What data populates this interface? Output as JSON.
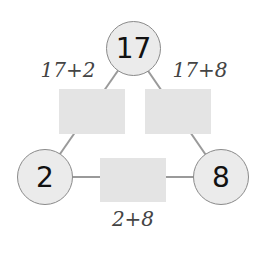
{
  "nodes": {
    "top": "17",
    "left": "2",
    "right": "8"
  },
  "edge_labels": {
    "top_left": "17+2",
    "top_right": "17+8",
    "bottom": "2+8"
  },
  "answer_boxes": {
    "top_left": "",
    "top_right": "",
    "bottom": ""
  },
  "colors": {
    "circle_fill": "#ebebeb",
    "circle_border": "#8a8a8a",
    "box_fill": "#e4e4e4",
    "line": "#9a9a9a"
  }
}
